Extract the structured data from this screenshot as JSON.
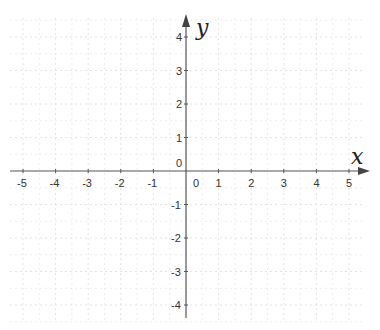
{
  "diagram": {
    "type": "cartesian-plane",
    "x_axis": {
      "label": "x",
      "min": -5,
      "max": 5,
      "ticks": [
        "-5",
        "-4",
        "-3",
        "-2",
        "-1",
        "0",
        "1",
        "2",
        "3",
        "4",
        "5"
      ]
    },
    "y_axis": {
      "label": "y",
      "min": -4,
      "max": 4,
      "ticks": [
        "4",
        "3",
        "2",
        "1",
        "0",
        "-1",
        "-2",
        "-3",
        "-4"
      ]
    },
    "origin_label": "0",
    "grid": "dashed",
    "colors": {
      "axis": "#555555",
      "grid": "#dddddd",
      "text": "#333333",
      "background": "#ffffff"
    }
  }
}
